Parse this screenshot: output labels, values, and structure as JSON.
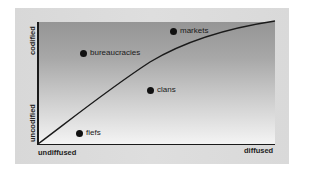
{
  "diagram": {
    "axes": {
      "y_top_label": "codified",
      "y_bottom_label": "uncodified",
      "x_left_label": "undiffused",
      "x_right_label": "diffused"
    },
    "points": [
      {
        "label": "markets",
        "x": 173,
        "y": 31
      },
      {
        "label": "bureaucracies",
        "x": 83,
        "y": 53
      },
      {
        "label": "clans",
        "x": 150,
        "y": 90
      },
      {
        "label": "fiefs",
        "x": 79,
        "y": 133
      }
    ],
    "colors": {
      "panel": "#dcdcdc",
      "plot_top": "#959595",
      "plot_bottom": "#f4f4f4",
      "ink": "#1a1a1a"
    }
  }
}
